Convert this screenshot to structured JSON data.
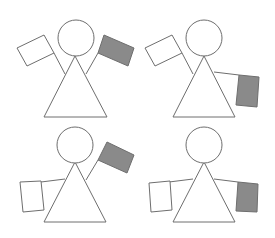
{
  "diagram": {
    "colors": {
      "outline": "#6e6e6e",
      "flag_white": "#ffffff",
      "flag_gray": "#8a8a8a",
      "background": "#ffffff"
    },
    "figures": [
      {
        "id": "top-left",
        "left_arm": "raised-up-left",
        "left_flag": "white",
        "right_arm": "raised-up-right",
        "right_flag": "gray"
      },
      {
        "id": "top-right",
        "left_arm": "raised-up-left",
        "left_flag": "white",
        "right_arm": "horizontal-right",
        "right_flag": "gray"
      },
      {
        "id": "bottom-left",
        "left_arm": "horizontal-left",
        "left_flag": "white",
        "right_arm": "raised-up-right",
        "right_flag": "gray"
      },
      {
        "id": "bottom-right",
        "left_arm": "horizontal-left",
        "left_flag": "white",
        "right_arm": "horizontal-right",
        "right_flag": "gray"
      }
    ]
  }
}
